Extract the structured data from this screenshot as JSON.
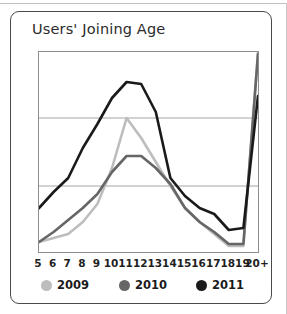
{
  "card": {
    "title": "Users' Joining Age"
  },
  "chart_data": {
    "type": "line",
    "title": "Users' Joining Age",
    "xlabel": "",
    "ylabel": "",
    "categories": [
      "5",
      "6",
      "7",
      "8",
      "9",
      "10",
      "11",
      "12",
      "13",
      "14",
      "15",
      "16",
      "17",
      "18",
      "19",
      "20+"
    ],
    "ylim": [
      0,
      100
    ],
    "grid": true,
    "gridlines": [
      0,
      33,
      67,
      100
    ],
    "legend_position": "bottom",
    "series": [
      {
        "name": "2009",
        "color": "#bdbdbd",
        "values": [
          5,
          7,
          9,
          15,
          24,
          42,
          67,
          57,
          45,
          33,
          22,
          15,
          9,
          3,
          3,
          100
        ]
      },
      {
        "name": "2010",
        "color": "#666666",
        "values": [
          5,
          10,
          16,
          22,
          29,
          40,
          48,
          48,
          42,
          34,
          22,
          15,
          10,
          4,
          4,
          99
        ]
      },
      {
        "name": "2011",
        "color": "#1a1a1a",
        "values": [
          22,
          30,
          37,
          52,
          64,
          77,
          85,
          84,
          70,
          37,
          28,
          22,
          19,
          11,
          12,
          78
        ]
      }
    ]
  },
  "x_axis": {
    "ticks": [
      "5",
      "6",
      "7",
      "8",
      "9",
      "10",
      "11",
      "12",
      "13",
      "14",
      "15",
      "16",
      "17",
      "18",
      "19",
      "20+"
    ]
  },
  "legend": {
    "items": [
      {
        "label": "2009",
        "color": "#bdbdbd"
      },
      {
        "label": "2010",
        "color": "#666666"
      },
      {
        "label": "2011",
        "color": "#1a1a1a"
      }
    ]
  },
  "colors": {
    "card_border": "#4a4a4a",
    "plot_border": "#8d8d8d",
    "gridline": "#9a9a9a",
    "background": "#ffffff",
    "text": "#1f1f1f"
  }
}
